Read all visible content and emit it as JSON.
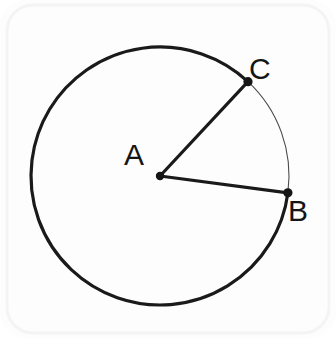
{
  "figure": {
    "kind": "circle-with-central-angle",
    "background_color": "#fdfdfd",
    "frame": {
      "corner_radius": 26,
      "border_color": "#f4f4f4",
      "border_width": 3
    },
    "circle": {
      "center_label": "A",
      "center_x": 160,
      "center_y": 176,
      "radius": 129,
      "major_arc_stroke_color": "#1a1a1a",
      "major_arc_stroke_width": 3.2,
      "minor_arc_stroke_color": "#4a4a4a",
      "minor_arc_stroke_width": 1.1
    },
    "points": [
      {
        "label": "A",
        "role": "center",
        "x": 160,
        "y": 176,
        "dot_radius": 4.2,
        "label_x": 144,
        "label_y": 165,
        "angle_degrees": null
      },
      {
        "label": "C",
        "role": "arc-endpoint",
        "x": 245,
        "y": 85,
        "dot_radius": 4.6,
        "label_x": 249,
        "label_y": 79,
        "angle_degrees": 47
      },
      {
        "label": "B",
        "role": "arc-endpoint",
        "x": 281,
        "y": 193,
        "dot_radius": 4.6,
        "label_x": 288,
        "label_y": 221,
        "angle_degrees": -7.5
      }
    ],
    "radii": [
      {
        "name": "radius-AC",
        "from": "A",
        "to": "C",
        "stroke_color": "#1a1a1a",
        "stroke_width": 3.2
      },
      {
        "name": "radius-AB",
        "from": "A",
        "to": "B",
        "stroke_color": "#1a1a1a",
        "stroke_width": 3.2
      }
    ],
    "labels": {
      "center": "A",
      "upper_right": "C",
      "lower_right": "B"
    },
    "colors": {
      "ink": "#151515",
      "stroke": "#1a1a1a",
      "thin_stroke": "#4a4a4a",
      "page": "#fdfdfd"
    }
  }
}
